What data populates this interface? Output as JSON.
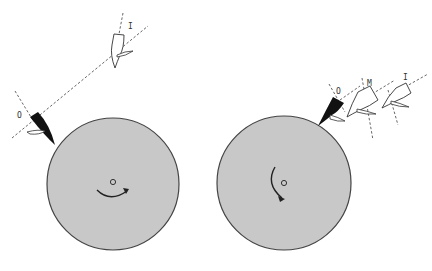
{
  "figure": {
    "panels": [
      {
        "id": "left",
        "wheel": {
          "cx": 113,
          "cy": 184,
          "r": 66,
          "fill": "#c8c8c8",
          "stroke": "#444444"
        },
        "rotation": "clockwise-bottom",
        "labels": {
          "inner": "I",
          "outer": "O"
        }
      },
      {
        "id": "right",
        "wheel": {
          "cx": 284,
          "cy": 183,
          "r": 67,
          "fill": "#c8c8c8",
          "stroke": "#444444"
        },
        "rotation": "counterclockwise-left",
        "labels": {
          "outer": "O",
          "middle": "M",
          "inner": "I"
        }
      }
    ],
    "colors": {
      "wheel": "#c8c8c8",
      "tool_tip": "#111111",
      "outline": "#444444",
      "dashed": "#555555"
    }
  }
}
